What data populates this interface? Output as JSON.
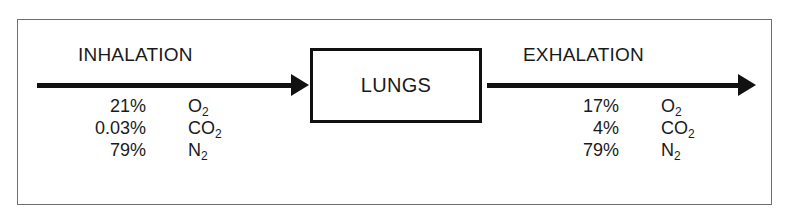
{
  "diagram": {
    "type": "flow",
    "colors": {
      "ink": "#111111",
      "frame": "#6f6f6f",
      "background": "#ffffff"
    },
    "left_section": {
      "heading": "INHALATION",
      "arrow_direction": "right",
      "gases": [
        {
          "percent": "21%",
          "formula_main": "O",
          "formula_sub": "2"
        },
        {
          "percent": "0.03%",
          "formula_main": "CO",
          "formula_sub": "2"
        },
        {
          "percent": "79%",
          "formula_main": "N",
          "formula_sub": "2"
        }
      ]
    },
    "center_node": {
      "label": "LUNGS"
    },
    "right_section": {
      "heading": "EXHALATION",
      "arrow_direction": "right",
      "gases": [
        {
          "percent": "17%",
          "formula_main": "O",
          "formula_sub": "2"
        },
        {
          "percent": "4%",
          "formula_main": "CO",
          "formula_sub": "2"
        },
        {
          "percent": "79%",
          "formula_main": "N",
          "formula_sub": "2"
        }
      ]
    }
  }
}
